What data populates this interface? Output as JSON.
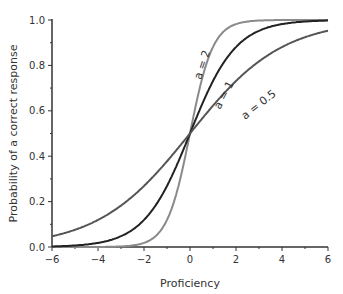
{
  "chart_data": {
    "type": "line",
    "title": "",
    "xlabel": "Proficiency",
    "ylabel": "Probability of a correct response",
    "xlim": [
      -6,
      6
    ],
    "ylim": [
      0,
      1
    ],
    "xticks": [
      "-6",
      "-4",
      "-2",
      "0",
      "2",
      "4",
      "6"
    ],
    "yticks": [
      "0.0",
      "0.2",
      "0.4",
      "0.6",
      "0.8",
      "1.0"
    ],
    "grid": false,
    "legend": "inline annotations",
    "series": [
      {
        "name": "a = 2",
        "a": 2,
        "color": "#8a8a8a",
        "x": [
          -6,
          -4,
          -2,
          -1,
          0,
          1,
          2,
          4,
          6
        ],
        "values": [
          0.0,
          0.0,
          0.02,
          0.12,
          0.5,
          0.88,
          0.98,
          1.0,
          1.0
        ]
      },
      {
        "name": "a = 1",
        "a": 1,
        "color": "#222222",
        "x": [
          -6,
          -4,
          -2,
          -1,
          0,
          1,
          2,
          4,
          6
        ],
        "values": [
          0.0,
          0.02,
          0.12,
          0.27,
          0.5,
          0.73,
          0.88,
          0.98,
          1.0
        ]
      },
      {
        "name": "a = 0.5",
        "a": 0.5,
        "color": "#555555",
        "x": [
          -6,
          -4,
          -2,
          -1,
          0,
          1,
          2,
          4,
          6
        ],
        "values": [
          0.05,
          0.12,
          0.27,
          0.38,
          0.5,
          0.62,
          0.73,
          0.88,
          0.95
        ]
      }
    ],
    "annotations": [
      "a = 2",
      "a = 1",
      "a = 0.5"
    ]
  }
}
